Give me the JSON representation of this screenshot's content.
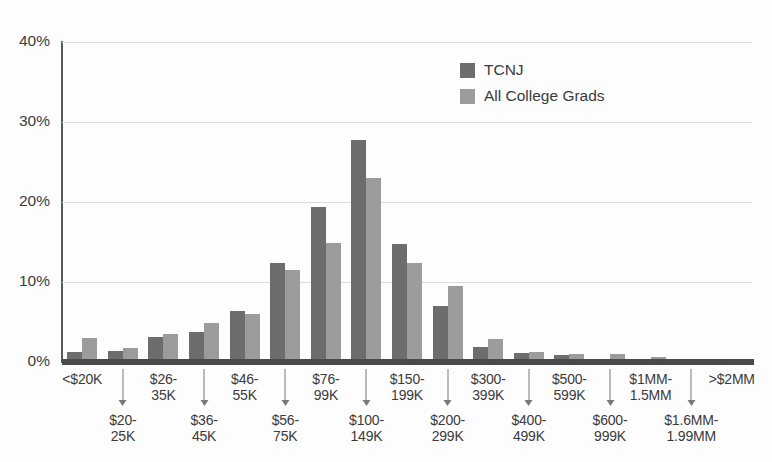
{
  "chart_data": {
    "type": "bar",
    "title": "",
    "subtitle": "",
    "xlabel": "",
    "ylabel": "",
    "ylim": [
      0,
      40
    ],
    "yticks": [
      "0%",
      "10%",
      "20%",
      "30%",
      "40%"
    ],
    "ytick_values": [
      0,
      10,
      20,
      30,
      40
    ],
    "grid": true,
    "legend_position": "top-center",
    "categories": [
      "<$20K",
      "$20-\n25K",
      "$26-\n35K",
      "$36-\n45K",
      "$46-\n55K",
      "$56-\n75K",
      "$76-\n99K",
      "$100-\n149K",
      "$150-\n199K",
      "$200-\n299K",
      "$300-\n399K",
      "$400-\n499K",
      "$500-\n599K",
      "$600-\n999K",
      "$1MM-\n1.5MM",
      "$1.6MM-\n1.99MM",
      ">$2MM"
    ],
    "category_rows": [
      "top",
      "bottom",
      "top",
      "bottom",
      "top",
      "bottom",
      "top",
      "bottom",
      "top",
      "bottom",
      "top",
      "bottom",
      "top",
      "bottom",
      "top",
      "bottom",
      "top"
    ],
    "series": [
      {
        "name": "TCNJ",
        "color": "#6d6d6d",
        "values": [
          1.2,
          1.4,
          3.1,
          3.8,
          6.4,
          12.4,
          19.4,
          27.8,
          14.8,
          7.0,
          1.9,
          1.1,
          0.9,
          0.2,
          0.2,
          0.15,
          0.2
        ]
      },
      {
        "name": "All College Grads",
        "color": "#9c9c9c",
        "values": [
          3.0,
          1.8,
          3.5,
          4.9,
          6.0,
          11.5,
          14.9,
          23.0,
          12.4,
          9.5,
          2.9,
          1.3,
          1.0,
          1.0,
          0.6,
          0.2,
          0.3
        ]
      }
    ]
  },
  "legend": {
    "items": [
      {
        "label": "TCNJ"
      },
      {
        "label": "All College Grads"
      }
    ]
  },
  "colors": {
    "series_tcnj": "#6d6d6d",
    "series_all_grads": "#9c9c9c",
    "gridline": "#dcdcdc",
    "axis": "#4a4a4a",
    "text": "#3b3b3b",
    "background": "#fdfdfd"
  }
}
